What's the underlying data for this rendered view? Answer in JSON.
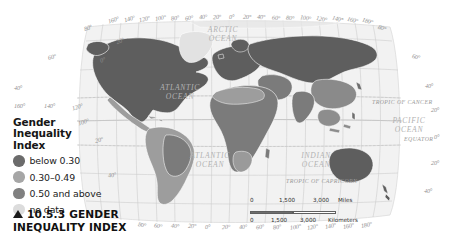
{
  "figure": {
    "caption_marker": "triangle-up",
    "caption_number": "10.5.3",
    "caption_title_line1": "GENDER",
    "caption_title_line2": "INEQUALITY INDEX"
  },
  "legend": {
    "title": "Gender\nInequality\nIndex",
    "items": [
      {
        "label": "below 0.30",
        "color": "#6b6b6b",
        "swatch_name": "legend-swatch-below-030"
      },
      {
        "label": "0.30–0.49",
        "color": "#a6a6a6",
        "swatch_name": "legend-swatch-030-049"
      },
      {
        "label": "0.50 and above",
        "color": "#808080",
        "swatch_name": "legend-swatch-050-above"
      },
      {
        "label": "no data",
        "color": "#dcdcdc",
        "swatch_name": "legend-swatch-no-data"
      }
    ]
  },
  "scalebar": {
    "miles": {
      "ticks": [
        "0",
        "1,500",
        "3,000"
      ],
      "unit": "Miles"
    },
    "kilometers": {
      "ticks": [
        "0",
        "1,500",
        "3,000"
      ],
      "unit": "Kilometers"
    }
  },
  "map": {
    "projection": "Robinson",
    "ocean_labels": [
      {
        "name": "arctic-ocean-label",
        "text": "ARCTIC\nOCEAN"
      },
      {
        "name": "atlantic-ocean-north-label",
        "text": "ATLANTIC\nOCEAN"
      },
      {
        "name": "atlantic-ocean-south-label",
        "text": "ATLANTIC\nOCEAN"
      },
      {
        "name": "indian-ocean-label",
        "text": "INDIAN\nOCEAN"
      },
      {
        "name": "pacific-ocean-label",
        "text": "PACIFIC\nOCEAN"
      }
    ],
    "reference_lines": [
      {
        "name": "tropic-of-cancer-label",
        "text": "TROPIC OF CANCER"
      },
      {
        "name": "equator-label",
        "text": "EQUATOR"
      },
      {
        "name": "tropic-of-capricorn-label",
        "text": "TROPIC OF CAPRICORN"
      }
    ],
    "longitude_labels_top": [
      "160°",
      "140°",
      "120°",
      "100°",
      "80°",
      "60°",
      "40°",
      "20°",
      "0°",
      "20°",
      "40°",
      "60°",
      "80°",
      "100°",
      "120°",
      "140°",
      "160°",
      "180°"
    ],
    "longitude_labels_bottom": [
      "80°",
      "60°",
      "40°",
      "20°",
      "0°",
      "20°",
      "40°",
      "60°",
      "80°",
      "100°",
      "120°",
      "140°",
      "160°",
      "180°"
    ],
    "latitude_labels_left": [
      "80°",
      "60°",
      "40°"
    ],
    "latitude_labels_left_lower": [
      "160°",
      "140°",
      "120°",
      "20°",
      "100°",
      "0°",
      "20°",
      "40°"
    ],
    "latitude_labels_right": [
      "80°",
      "60°",
      "40°",
      "20°",
      "0°",
      "20°",
      "40°"
    ]
  },
  "colors": {
    "land_below_030": "#6b6b6b",
    "land_030_049": "#a6a6a6",
    "land_050_above": "#808080",
    "land_no_data": "#dcdcdc",
    "ocean": "#f2f2f2",
    "graticule": "#c8c8c8",
    "border": "#ffffff"
  }
}
